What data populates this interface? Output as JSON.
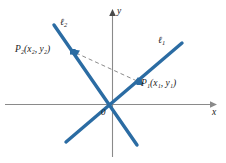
{
  "figure": {
    "background_color": "#ffffff",
    "line_color": "#2b6ca3",
    "axis_color": "#8a8a8a",
    "text_color": "#1a1a1a",
    "dashed_color": "#7d7d7d"
  },
  "axes": {
    "x_label": "x",
    "y_label": "y",
    "origin_label": "0"
  },
  "lines": [
    {
      "name": "line-1",
      "label": "ℓ",
      "label_sub": "1",
      "slope_sign": "positive",
      "x1": 66,
      "y1": 142,
      "x2": 182,
      "y2": 43
    },
    {
      "name": "line-2",
      "label": "ℓ",
      "label_sub": "2",
      "slope_sign": "negative",
      "x1": 54,
      "y1": 25,
      "x2": 137,
      "y2": 145
    }
  ],
  "points": [
    {
      "name": "point-p1",
      "label": "P",
      "label_sub": "1",
      "coords_text": "(x₁, y₁)",
      "label_full": "P₁(x₁, y₁)",
      "x": 139,
      "y": 82
    },
    {
      "name": "point-p2",
      "label": "P",
      "label_sub": "2",
      "coords_text": "(x₂, y₂)",
      "label_full": "P₂(x₂, y₂)",
      "x": 73,
      "y": 52
    }
  ],
  "connector": {
    "name": "dashed-segment-p1-p2",
    "style": "dashed",
    "from": "P2",
    "to": "P1"
  }
}
